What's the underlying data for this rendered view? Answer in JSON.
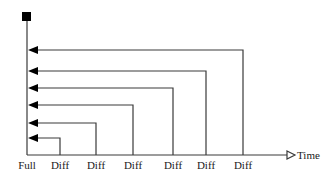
{
  "diagram": {
    "type": "backup-timeline",
    "axis": {
      "time_label": "Time",
      "origin_label": "Full"
    },
    "backups": [
      {
        "label": "Diff",
        "x": 60,
        "arrow_y": 138
      },
      {
        "label": "Diff",
        "x": 96,
        "arrow_y": 123
      },
      {
        "label": "Diff",
        "x": 133,
        "arrow_y": 105
      },
      {
        "label": "Diff",
        "x": 173,
        "arrow_y": 88
      },
      {
        "label": "Diff",
        "x": 206,
        "arrow_y": 71
      },
      {
        "label": "Diff",
        "x": 243,
        "arrow_y": 50
      }
    ],
    "colors": {
      "line": "#3a3a3a",
      "marker": "#000000",
      "text": "#1a1a1a"
    }
  }
}
